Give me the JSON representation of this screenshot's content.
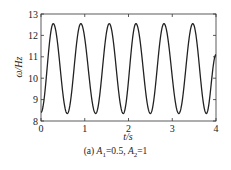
{
  "chart_data": {
    "type": "line",
    "title": "",
    "caption": "(a) A1=0.5, A2=1",
    "caption_parts": {
      "prefix": "(a) ",
      "a1_sym": "A",
      "a1_sub": "1",
      "a1_val": "=0.5, ",
      "a2_sym": "A",
      "a2_sub": "2",
      "a2_val": "=1"
    },
    "xlabel": "t/s",
    "ylabel": "ω/Hz",
    "xlim": [
      0,
      4
    ],
    "ylim": [
      8,
      13
    ],
    "xticks": [
      0,
      1,
      2,
      3,
      4
    ],
    "yticks": [
      8,
      9,
      10,
      11,
      12,
      13
    ],
    "grid": false,
    "legend": null,
    "series": [
      {
        "name": "ω(t)",
        "color": "#222222",
        "description": "periodic oscillation, period ≈0.64 s, min ≈8.35, max ≈12.55",
        "x": [
          0,
          0.28,
          0.6,
          0.91,
          1.25,
          1.56,
          1.88,
          2.17,
          2.5,
          2.81,
          3.15,
          3.47,
          3.78,
          4.0
        ],
        "y": [
          8.4,
          12.55,
          8.35,
          12.55,
          8.35,
          12.55,
          8.35,
          12.55,
          8.35,
          12.55,
          8.35,
          12.55,
          8.35,
          11.1
        ]
      }
    ]
  }
}
